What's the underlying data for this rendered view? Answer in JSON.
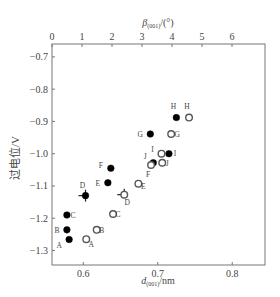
{
  "chart_data": {
    "type": "scatter",
    "title": "",
    "xlabel": "d(001)/nm",
    "xlabel_main": "d",
    "xlabel_sub": "(001)",
    "xlabel_unit": "/nm",
    "x2label_main": "β",
    "x2label_sub": "(001)",
    "x2label_unit": "/(°)",
    "ylabel": "过电位/V",
    "xlim": [
      0.558,
      0.844
    ],
    "ylim": [
      -1.345,
      -0.66
    ],
    "x2lim": [
      0,
      7.1
    ],
    "xticks": [
      0.6,
      0.7,
      0.8
    ],
    "xtick_labels": [
      "0.6",
      "0.7",
      "0.8"
    ],
    "x2ticks": [
      0,
      1,
      2,
      3,
      4,
      5,
      6
    ],
    "x2tick_labels": [
      "0",
      "1",
      "2",
      "3",
      "4",
      "5",
      "6"
    ],
    "yticks": [
      -0.7,
      -0.8,
      -0.9,
      -1.0,
      -1.1,
      -1.2,
      -1.3
    ],
    "ytick_labels": [
      "-0.7",
      "-0.8",
      "-0.9",
      "-1.0",
      "-1.1",
      "-1.2",
      "-1.3"
    ],
    "grid": false,
    "series": [
      {
        "name": "d(001) (filled)",
        "marker": "filled-circle",
        "points": [
          {
            "label": "A",
            "x": 0.581,
            "y": -1.266,
            "lx": -10,
            "ly": 8
          },
          {
            "label": "B",
            "x": 0.578,
            "y": -1.236,
            "lx": -10,
            "ly": 3
          },
          {
            "label": "C",
            "x": 0.578,
            "y": -1.19,
            "lx": 6,
            "ly": 3
          },
          {
            "label": "D",
            "x": 0.603,
            "y": -1.13,
            "lx": -3,
            "ly": -8,
            "err": true
          },
          {
            "label": "E",
            "x": 0.633,
            "y": -1.09,
            "lx": -10,
            "ly": 3
          },
          {
            "label": "F",
            "x": 0.637,
            "y": -1.045,
            "lx": -10,
            "ly": 0
          },
          {
            "label": "G",
            "x": 0.69,
            "y": -0.939,
            "lx": -10,
            "ly": 3
          },
          {
            "label": "H",
            "x": 0.725,
            "y": -0.888,
            "lx": -3,
            "ly": -9
          },
          {
            "label": "I",
            "x": 0.715,
            "y": -1.0,
            "lx": 6,
            "ly": 2
          },
          {
            "label": "J",
            "x": 0.694,
            "y": -1.028,
            "lx": -8,
            "ly": -4
          }
        ]
      },
      {
        "name": "β(001) (open)",
        "marker": "open-circle",
        "points": [
          {
            "label": "A",
            "x": 0.604,
            "y": -1.265,
            "lx": 5,
            "ly": 8
          },
          {
            "label": "B",
            "x": 0.618,
            "y": -1.236,
            "lx": 5,
            "ly": 3
          },
          {
            "label": "C",
            "x": 0.64,
            "y": -1.187,
            "lx": 5,
            "ly": 3
          },
          {
            "label": "D",
            "x": 0.655,
            "y": -1.127,
            "lx": 3,
            "ly": 10,
            "err": true
          },
          {
            "label": "E",
            "x": 0.674,
            "y": -1.093,
            "lx": 5,
            "ly": 5
          },
          {
            "label": "F",
            "x": 0.691,
            "y": -1.035,
            "lx": -3,
            "ly": 12
          },
          {
            "label": "G",
            "x": 0.718,
            "y": -0.939,
            "lx": 6,
            "ly": 3
          },
          {
            "label": "H",
            "x": 0.742,
            "y": -0.888,
            "lx": -2,
            "ly": -9
          },
          {
            "label": "I",
            "x": 0.705,
            "y": -1.0,
            "lx": -9,
            "ly": -2
          },
          {
            "label": "J",
            "x": 0.706,
            "y": -1.028,
            "lx": 5,
            "ly": 3
          }
        ]
      }
    ]
  }
}
